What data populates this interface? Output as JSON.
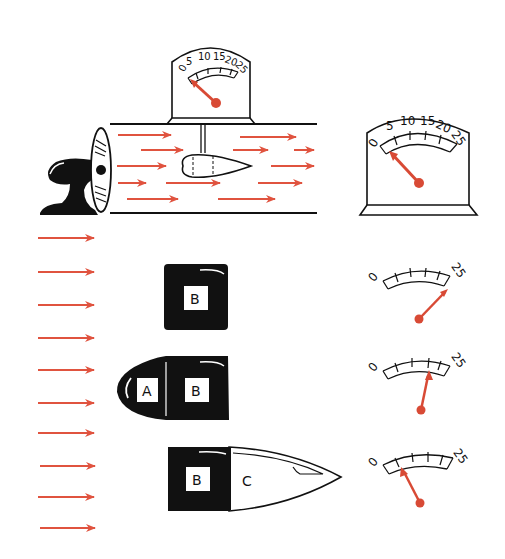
{
  "diagram": {
    "colors": {
      "arrow": "#e0533f",
      "needle": "#d84a35",
      "ink": "#111111",
      "background": "#ffffff"
    },
    "tunnel": {
      "description": "Fan blowing air through a tunnel past a streamlined body attached to a drag gauge",
      "gauge": {
        "scale_labels": [
          "0",
          "5",
          "10",
          "15",
          "20",
          "25"
        ],
        "reading": 3
      }
    },
    "standalone_gauge": {
      "scale_labels": [
        "0",
        "5",
        "10",
        "15",
        "20",
        "25"
      ],
      "reading": 3
    },
    "airflow_arrows_count": 10,
    "shapes": [
      {
        "name": "flat block",
        "segments": [
          "B"
        ],
        "gauge": {
          "min_label": "0",
          "max_label": "25",
          "reading": 24
        }
      },
      {
        "name": "rounded nose block",
        "segments": [
          "A",
          "B"
        ],
        "gauge": {
          "min_label": "0",
          "max_label": "25",
          "reading": 14
        }
      },
      {
        "name": "streamlined tail block",
        "segments": [
          "B",
          "C"
        ],
        "gauge": {
          "min_label": "0",
          "max_label": "25",
          "reading": 4
        }
      }
    ]
  }
}
